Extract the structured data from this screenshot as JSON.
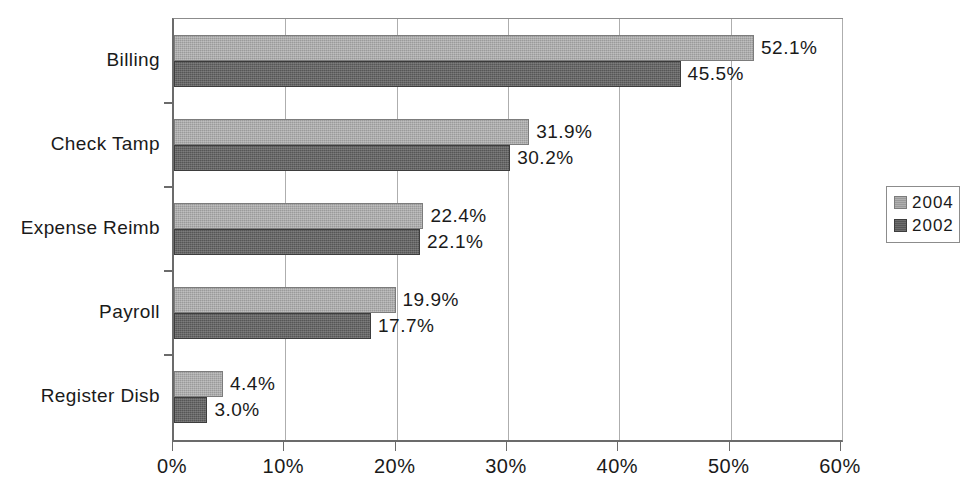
{
  "chart_data": {
    "type": "bar",
    "orientation": "horizontal",
    "title": "",
    "subtitle": "",
    "xlabel": "",
    "ylabel": "",
    "xlim": [
      0,
      60
    ],
    "xtick_values": [
      0,
      10,
      20,
      30,
      40,
      50,
      60
    ],
    "xtick_labels": [
      "0%",
      "10%",
      "20%",
      "30%",
      "40%",
      "50%",
      "60%"
    ],
    "grid": true,
    "grid_axis": "x",
    "legend_position": "right",
    "categories": [
      "Billing",
      "Check Tamp",
      "Expense Reimb",
      "Payroll",
      "Register Disb"
    ],
    "series": [
      {
        "name": "2004",
        "color": "#9a9a9a",
        "values": [
          52.1,
          31.9,
          22.4,
          19.9,
          4.4
        ],
        "labels": [
          "52.1%",
          "31.9%",
          "22.4%",
          "19.9%",
          "4.4%"
        ]
      },
      {
        "name": "2002",
        "color": "#565656",
        "values": [
          45.5,
          30.2,
          22.1,
          17.7,
          3.0
        ],
        "labels": [
          "45.5%",
          "30.2%",
          "22.1%",
          "17.7%",
          "3.0%"
        ]
      }
    ]
  },
  "legend": {
    "items": [
      {
        "label": "2004",
        "swatch": "series-a"
      },
      {
        "label": "2002",
        "swatch": "series-b"
      }
    ]
  }
}
